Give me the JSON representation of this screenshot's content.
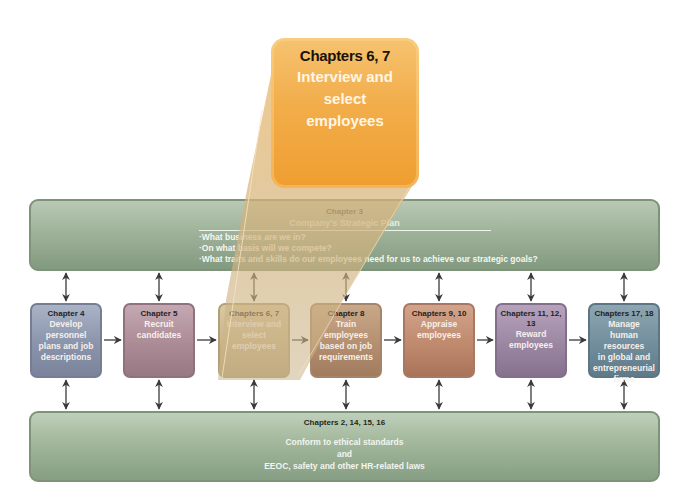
{
  "callout": {
    "chapters": "Chapters 6, 7",
    "label_lines": [
      "Interview and",
      "select",
      "employees"
    ],
    "color": "#f2ad4a"
  },
  "strategy_bar": {
    "chapter": "Chapter 3",
    "title": "Company's Strategic Plan",
    "questions": [
      "What business are we in?",
      "On what basis will we compete?",
      "What traits and skills do our employees need for us to achieve our strategic goals?"
    ],
    "color": "#9fb39a"
  },
  "steps": [
    {
      "chapter": "Chapter 4",
      "label_lines": [
        "Develop",
        "personnel",
        "plans and job",
        "descriptions"
      ],
      "color": "#8c96ad"
    },
    {
      "chapter": "Chapter 5",
      "label_lines": [
        "Recruit",
        "candidates"
      ],
      "color": "#ab8b96"
    },
    {
      "chapter": "Chapters 6, 7",
      "label_lines": [
        "Interview and",
        "select",
        "employees"
      ],
      "color": "#c9b48a"
    },
    {
      "chapter": "Chapter 8",
      "label_lines": [
        "Train",
        "employees",
        "based on job",
        "requirements"
      ],
      "color": "#b58f70"
    },
    {
      "chapter": "Chapters 9, 10",
      "label_lines": [
        "Appraise",
        "employees"
      ],
      "color": "#bf8a6e"
    },
    {
      "chapter": "Chapters 11, 12, 13",
      "label_lines": [
        "Reward",
        "employees"
      ],
      "color": "#9c87a3"
    },
    {
      "chapter": "Chapters 17, 18",
      "label_lines": [
        "Manage",
        "human resources",
        "in global and",
        "entrepreneurial",
        "firms"
      ],
      "color": "#728e9c"
    }
  ],
  "ethics_bar": {
    "chapter": "Chapters 2, 14, 15, 16",
    "lines": [
      "Conform to ethical standards",
      "and",
      "EEOC, safety and other HR-related laws"
    ],
    "color": "#a4b99e"
  },
  "connectors": {
    "flow": "step-to-step right arrows",
    "vertical": "double-headed arrows between each step and both bars"
  }
}
